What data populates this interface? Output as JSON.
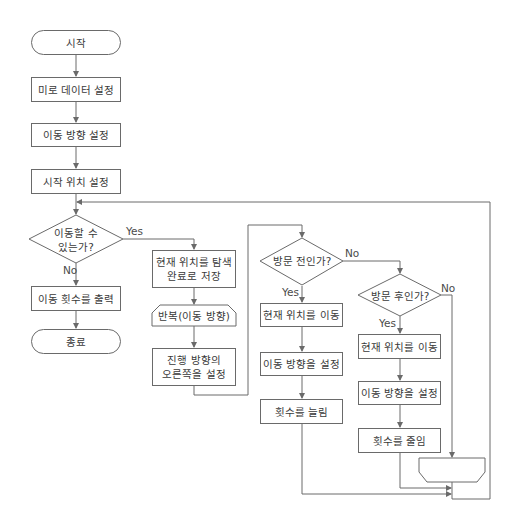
{
  "diagram": {
    "type": "flowchart",
    "nodes": {
      "start": "시작",
      "set_maze": "미로 데이터 설정",
      "set_direction": "이동 방향 설정",
      "set_start_pos": "시작 위치 설정",
      "can_move": "이동할 수\n있는가?",
      "print_moves": "이동 횟수를 출력",
      "end": "종료",
      "save_visited": "현재 위치를 탐색\n완료로 저장",
      "loop_header": "반복(이동 방향)",
      "set_right": "진행 방향의\n오른쪽을 설정",
      "before_visit": "방문 전인가?",
      "move_pos_a": "현재 위치를 이동",
      "set_dir_a": "이동 방향을 설정",
      "inc_count": "횟수를 늘림",
      "after_visit": "방문 후인가?",
      "move_pos_b": "현재 위치를 이동",
      "set_dir_b": "이동 방향을 설정",
      "dec_count": "횟수를 줄임",
      "loop_end": ""
    },
    "edge_labels": {
      "can_move_yes": "Yes",
      "can_move_no": "No",
      "before_visit_yes": "Yes",
      "before_visit_no": "No",
      "after_visit_yes": "Yes",
      "after_visit_no": "No"
    },
    "colors": {
      "line": "#6a6a6a",
      "text": "#3a3a3a",
      "background": "#ffffff"
    }
  }
}
